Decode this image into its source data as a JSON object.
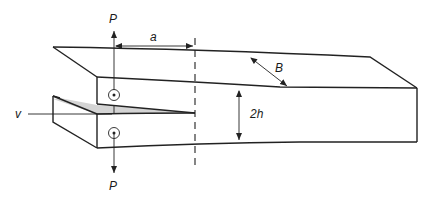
{
  "diagram": {
    "type": "double-cantilever-beam specimen",
    "labels": {
      "load_top": "P",
      "load_bottom": "P",
      "crack_length": "a",
      "width": "B",
      "height": "2h",
      "opening": "v"
    },
    "colors": {
      "line": "#222222",
      "crack_fill": "#d4d4d4",
      "background": "#ffffff"
    }
  }
}
